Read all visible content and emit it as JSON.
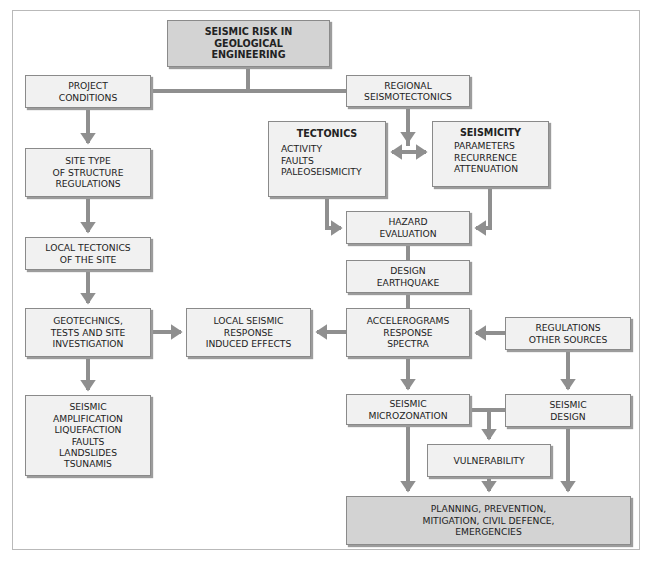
{
  "diagram": {
    "colors": {
      "box_fill": "#f1f1f1",
      "box_fill_highlight": "#d3d3d3",
      "box_border": "#8a8a8a",
      "connector": "#8f8f8f",
      "frame_border": "#b9b9b9"
    },
    "nodes": {
      "root": {
        "lines": [
          "SEISMIC RISK IN",
          "GEOLOGICAL",
          "ENGINEERING"
        ]
      },
      "project_conditions": {
        "lines": [
          "PROJECT",
          "CONDITIONS"
        ]
      },
      "regional_seismotectonics": {
        "lines": [
          "REGIONAL",
          "SEISMOTECTONICS"
        ]
      },
      "tectonics": {
        "heading": "TECTONICS",
        "items": [
          "ACTIVITY",
          "FAULTS",
          "PALEOSEISMICITY"
        ]
      },
      "seismicity": {
        "heading": "SEISMICITY",
        "items": [
          "PARAMETERS",
          "RECURRENCE",
          "ATTENUATION"
        ]
      },
      "site_type": {
        "lines": [
          "SITE TYPE",
          "OF STRUCTURE",
          "REGULATIONS"
        ]
      },
      "hazard_evaluation": {
        "lines": [
          "HAZARD",
          "EVALUATION"
        ]
      },
      "local_tectonics": {
        "lines": [
          "LOCAL TECTONICS",
          "OF THE SITE"
        ]
      },
      "design_earthquake": {
        "lines": [
          "DESIGN",
          "EARTHQUAKE"
        ]
      },
      "geotechnics": {
        "lines": [
          "GEOTECHNICS,",
          "TESTS AND SITE",
          "INVESTIGATION"
        ]
      },
      "local_seismic_response": {
        "lines": [
          "LOCAL SEISMIC",
          "RESPONSE",
          "INDUCED EFFECTS"
        ]
      },
      "accelerograms": {
        "lines": [
          "ACCELEROGRAMS",
          "RESPONSE",
          "SPECTRA"
        ]
      },
      "regulations_other_sources": {
        "lines": [
          "REGULATIONS",
          "OTHER SOURCES"
        ]
      },
      "seismic_effects": {
        "lines": [
          "SEISMIC",
          "AMPLIFICATION",
          "LIQUEFACTION",
          "FAULTS",
          "LANDSLIDES",
          "TSUNAMIS"
        ]
      },
      "seismic_microzonation": {
        "lines": [
          "SEISMIC",
          "MICROZONATION"
        ]
      },
      "seismic_design": {
        "lines": [
          "SEISMIC",
          "DESIGN"
        ]
      },
      "vulnerability": {
        "lines": [
          "VULNERABILITY"
        ]
      },
      "planning": {
        "lines": [
          "PLANNING, PREVENTION,",
          "MITIGATION, CIVIL DEFENCE,",
          "EMERGENCIES"
        ]
      }
    },
    "edges": [
      [
        "root",
        "project_conditions"
      ],
      [
        "root",
        "regional_seismotectonics"
      ],
      [
        "project_conditions",
        "site_type"
      ],
      [
        "site_type",
        "local_tectonics"
      ],
      [
        "local_tectonics",
        "geotechnics"
      ],
      [
        "geotechnics",
        "seismic_effects"
      ],
      [
        "geotechnics",
        "local_seismic_response"
      ],
      [
        "regional_seismotectonics",
        "tectonics"
      ],
      [
        "regional_seismotectonics",
        "seismicity"
      ],
      [
        "tectonics",
        "hazard_evaluation"
      ],
      [
        "seismicity",
        "hazard_evaluation"
      ],
      [
        "hazard_evaluation",
        "design_earthquake"
      ],
      [
        "design_earthquake",
        "accelerograms"
      ],
      [
        "accelerograms",
        "local_seismic_response"
      ],
      [
        "regulations_other_sources",
        "accelerograms"
      ],
      [
        "accelerograms",
        "seismic_microzonation"
      ],
      [
        "regulations_other_sources",
        "seismic_design"
      ],
      [
        "seismic_microzonation",
        "vulnerability"
      ],
      [
        "seismic_design",
        "vulnerability"
      ],
      [
        "seismic_microzonation",
        "planning"
      ],
      [
        "vulnerability",
        "planning"
      ],
      [
        "seismic_design",
        "planning"
      ]
    ]
  }
}
